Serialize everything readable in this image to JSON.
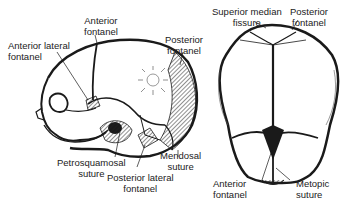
{
  "figure": {
    "lateral_view": {
      "labels": {
        "anterior_fontanel": [
          "Anterior",
          "fontanel"
        ],
        "anterior_lateral_fontanel": [
          "Anterior lateral",
          "fontanel"
        ],
        "posterior_fontanel": [
          "Posterior",
          "fontanel"
        ],
        "petrosquamosal_suture": [
          "Petrosquamosal",
          "suture"
        ],
        "posterior_lateral_fontanel": [
          "Posterior lateral",
          "fontanel"
        ],
        "mendosal_suture": [
          "Mendosal",
          "suture"
        ]
      }
    },
    "superior_view": {
      "labels": {
        "superior_median_fissure": [
          "Superior median",
          "fissure"
        ],
        "posterior_fontanel": [
          "Posterior",
          "fontanel"
        ],
        "anterior_fontanel": [
          "Anterior",
          "fontanel"
        ],
        "metopic_suture": [
          "Metopic",
          "suture"
        ]
      }
    },
    "colors": {
      "ink": "#1a1a1a",
      "background": "#ffffff"
    }
  }
}
